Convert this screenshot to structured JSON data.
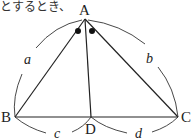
{
  "caption": "とするとき、",
  "diagram": {
    "points": {
      "A": {
        "label": "A",
        "x": 85,
        "y": 19
      },
      "B": {
        "label": "B",
        "x": 15,
        "y": 117
      },
      "C": {
        "label": "C",
        "x": 178,
        "y": 117
      },
      "D": {
        "label": "D",
        "x": 91,
        "y": 117
      }
    },
    "segments": [
      "AB",
      "AC",
      "BC",
      "AD"
    ],
    "angle_marks": "two equal angles at A (BAD = DAC) marked with dots",
    "arc_labels": {
      "a": "a",
      "b": "b",
      "c": "c",
      "d": "d"
    }
  }
}
